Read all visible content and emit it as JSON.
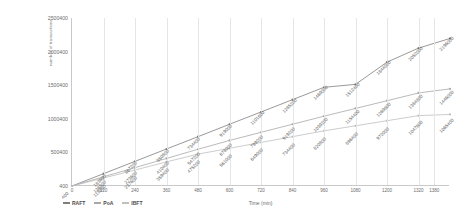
{
  "chart": {
    "ylabel": "number of transactions",
    "xlabel": "Time (min)",
    "yticks": [
      "2500400",
      "2000400",
      "1500400",
      "1000400",
      "500400",
      "400"
    ],
    "xticks": [
      "0",
      "120",
      "240",
      "360",
      "480",
      "600",
      "720",
      "840",
      "960",
      "1080",
      "1200",
      "1320",
      "1380"
    ]
  },
  "legend": [
    {
      "label": "RAFT",
      "color": "#7f7f7f"
    },
    {
      "label": "PoA",
      "color": "#a8a8a8"
    },
    {
      "label": "IBFT",
      "color": "#bfbfbf"
    }
  ],
  "chart_data": {
    "type": "line",
    "title": "",
    "xlabel": "Time (min)",
    "ylabel": "number of transactions",
    "xlim": [
      0,
      1440
    ],
    "ylim": [
      400,
      2500400
    ],
    "grid": true,
    "legend_position": "bottom-left",
    "x": [
      0,
      120,
      240,
      360,
      480,
      600,
      720,
      840,
      960,
      1080,
      1200,
      1320,
      1440
    ],
    "series": [
      {
        "name": "RAFT",
        "color": "#7f7f7f",
        "values": [
          400,
          183600,
          367200,
          550800,
          734400,
          919000,
          1101600,
          1285200,
          1469000,
          1512400,
          1844000,
          2052000,
          2196000
        ],
        "labels": [
          "400",
          "183600",
          "367200",
          "550800",
          "734400",
          "919000",
          "1101600",
          "1285200",
          "1469000",
          "1512400",
          "1844000",
          "2052000",
          "2196000"
        ]
      },
      {
        "name": "PoA",
        "color": "#a8a8a8",
        "values": [
          400,
          136800,
          273600,
          410400,
          547200,
          678000,
          799200,
          919200,
          1039200,
          1154400,
          1269600,
          1384800,
          1446000
        ],
        "labels": [
          "400",
          "136800",
          "273600",
          "410400",
          "547200",
          "678000",
          "799200",
          "919200",
          "1039200",
          "1154400",
          "1269600",
          "1384800",
          "1446000"
        ]
      },
      {
        "name": "IBFT",
        "color": "#bfbfbf",
        "values": [
          400,
          118800,
          237600,
          359400,
          475200,
          561000,
          649000,
          734400,
          820800,
          896400,
          972000,
          1047600,
          1065400
        ],
        "labels": [
          "400",
          "118800",
          "237600",
          "359400",
          "475200",
          "561000",
          "649000",
          "734400",
          "820800",
          "896400",
          "972000",
          "1047600",
          "1065400"
        ]
      }
    ]
  }
}
